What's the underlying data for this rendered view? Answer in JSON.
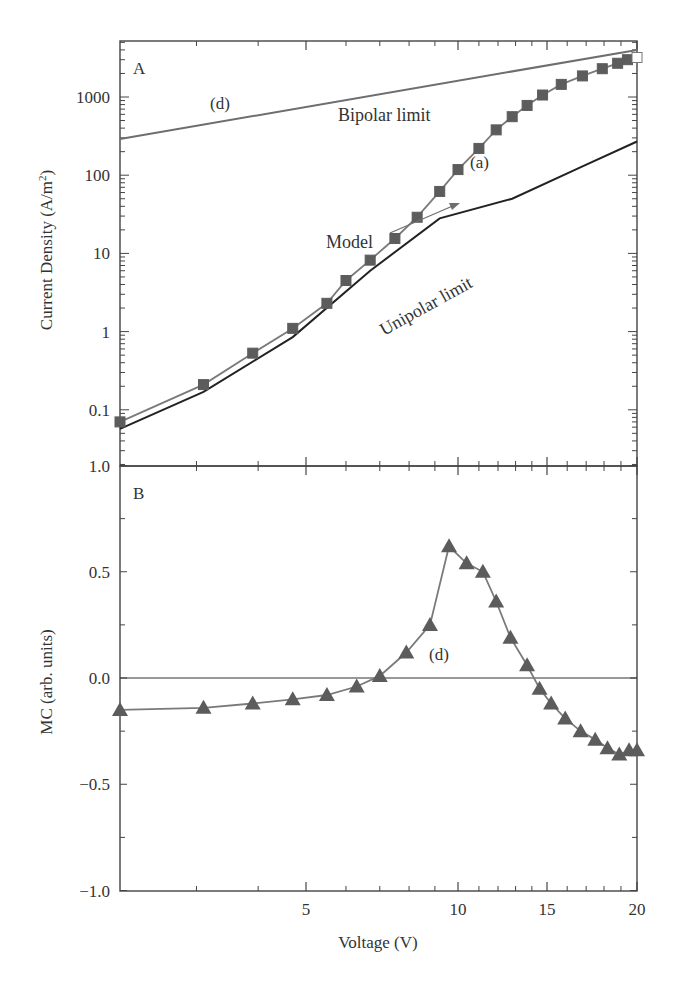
{
  "figure": {
    "panel_a_label": "A",
    "panel_b_label": "B",
    "x_axis_label": "Voltage (V)",
    "y_axis_label_a": "Current Density (A/m",
    "y_axis_label_a_sup": "2",
    "y_axis_label_a_close": ")",
    "y_axis_label_b": "MC (arb. units)"
  },
  "annotations": {
    "bipolar_curve_tag": "(d)",
    "bipolar_limit": "Bipolar limit",
    "model_curve_tag": "(a)",
    "model": "Model",
    "unipolar_limit": "Unipolar limit",
    "mc_curve_tag": "(d)"
  },
  "colors": {
    "axis": "#444444",
    "bipolar_line": "#6e6e6e",
    "model_line": "#7a7a7a",
    "marker": "#5c5c5c",
    "unipolar_line": "#222222",
    "zero_line": "#333333"
  },
  "chart_data": [
    {
      "type": "line",
      "title": "A",
      "xlabel": "Voltage (V)",
      "ylabel": "Current Density (A/m^2)",
      "xscale": "log",
      "yscale": "log",
      "xlim": [
        2.1,
        20
      ],
      "ylim": [
        0.019,
        5200
      ],
      "x_ticks": [
        5,
        10,
        15,
        20
      ],
      "y_tick_labels": [
        "0.1",
        "1",
        "10",
        "100",
        "1000"
      ],
      "grid": false,
      "series": [
        {
          "name": "Bipolar limit (d)",
          "x": [
            2.1,
            20
          ],
          "values": [
            290,
            4000
          ]
        },
        {
          "name": "Model (a) - squares",
          "marker": "square",
          "x": [
            2.1,
            3.1,
            3.9,
            4.7,
            5.5,
            6.0,
            6.7,
            7.5,
            8.3,
            9.2,
            10.0,
            11.0,
            11.9,
            12.8,
            13.7,
            14.7,
            15.7,
            16.8,
            17.9,
            18.8,
            19.4,
            20.0
          ],
          "values": [
            0.07,
            0.21,
            0.53,
            1.1,
            2.3,
            4.5,
            8.2,
            15.5,
            29,
            62,
            118,
            220,
            380,
            560,
            780,
            1060,
            1450,
            1860,
            2300,
            2700,
            3000,
            3200
          ]
        },
        {
          "name": "Unipolar limit",
          "x": [
            2.1,
            3.1,
            4.7,
            6.7,
            9.2,
            12.8,
            16.8,
            20.0
          ],
          "values": [
            0.057,
            0.17,
            0.85,
            6.0,
            28,
            50,
            130,
            270
          ]
        }
      ]
    },
    {
      "type": "line",
      "title": "B",
      "xlabel": "Voltage (V)",
      "ylabel": "MC (arb. units)",
      "xscale": "log",
      "xlim": [
        2.1,
        20
      ],
      "ylim": [
        -1.0,
        1.0
      ],
      "x_ticks": [
        5,
        10,
        15,
        20
      ],
      "y_tick_labels": [
        "1.0",
        "0.5",
        "0.0",
        "-0.5",
        "-1.0"
      ],
      "grid": false,
      "reference_line": 0.0,
      "series": [
        {
          "name": "MC (d) - triangles",
          "marker": "triangle",
          "x": [
            2.1,
            3.1,
            3.9,
            4.7,
            5.5,
            6.3,
            7.0,
            7.9,
            8.8,
            9.6,
            10.4,
            11.2,
            11.9,
            12.7,
            13.7,
            14.5,
            15.2,
            15.9,
            16.7,
            17.5,
            18.2,
            18.9,
            19.5,
            20.0
          ],
          "values": [
            -0.15,
            -0.14,
            -0.12,
            -0.1,
            -0.08,
            -0.04,
            0.01,
            0.12,
            0.25,
            0.62,
            0.54,
            0.5,
            0.36,
            0.19,
            0.06,
            -0.05,
            -0.12,
            -0.19,
            -0.25,
            -0.29,
            -0.33,
            -0.36,
            -0.34,
            -0.34
          ]
        }
      ]
    }
  ]
}
